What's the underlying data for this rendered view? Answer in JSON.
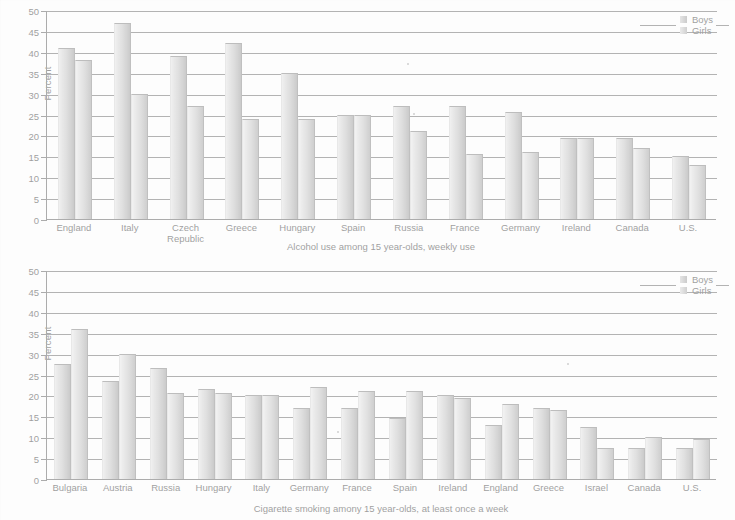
{
  "legend": {
    "boys": "Boys",
    "girls": "Girls"
  },
  "axis": {
    "ylabel": "Percent",
    "yticks": [
      "0",
      "5",
      "10",
      "15",
      "20",
      "25",
      "30",
      "35",
      "40",
      "45",
      "50"
    ]
  },
  "chart_data": [
    {
      "type": "bar",
      "title": "",
      "caption": "Alcohol use among 15 year-olds, weekly use",
      "xlabel": "",
      "ylabel": "Percent",
      "ylim": [
        0,
        50
      ],
      "ytick_step": 5,
      "grid": true,
      "legend_position": "top-right",
      "categories": [
        "England",
        "Italy",
        "Czech Republic",
        "Greece",
        "Hungary",
        "Spain",
        "Russia",
        "France",
        "Germany",
        "Ireland",
        "Canada",
        "U.S."
      ],
      "series": [
        {
          "name": "Boys",
          "values": [
            41,
            47,
            39,
            42,
            35,
            25,
            27,
            27,
            25.5,
            19.5,
            19.5,
            15
          ]
        },
        {
          "name": "Girls",
          "values": [
            38,
            30,
            27,
            24,
            24,
            25,
            21,
            15.5,
            16,
            19.5,
            17,
            13
          ]
        }
      ]
    },
    {
      "type": "bar",
      "title": "",
      "caption": "Cigarette smoking amony 15 year-olds, at least once a week",
      "xlabel": "",
      "ylabel": "Percent",
      "ylim": [
        0,
        50
      ],
      "ytick_step": 5,
      "grid": true,
      "legend_position": "top-right",
      "categories": [
        "Bulgaria",
        "Austria",
        "Russia",
        "Hungary",
        "Italy",
        "Germany",
        "France",
        "Spain",
        "Ireland",
        "England",
        "Greece",
        "Israel",
        "Canada",
        "U.S."
      ],
      "series": [
        {
          "name": "Boys",
          "values": [
            27.5,
            23.5,
            26.5,
            21.5,
            20,
            17,
            17,
            14.5,
            20,
            13,
            17,
            12.5,
            7.5,
            7.5
          ]
        },
        {
          "name": "Girls",
          "values": [
            36,
            30,
            20.5,
            20.5,
            20,
            22,
            21,
            21,
            19.5,
            18,
            16.5,
            7.5,
            10,
            9.5
          ]
        }
      ]
    }
  ]
}
